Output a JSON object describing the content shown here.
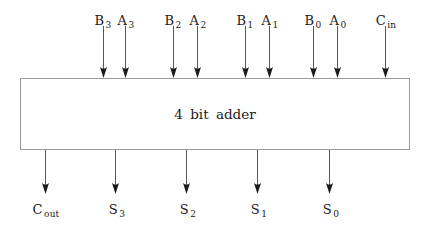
{
  "diagram": {
    "title": "4 bit adder",
    "block_label": "4  bit  adder",
    "type": "block-diagram",
    "background_color": "#ffffff",
    "line_color": "#58585a",
    "box_border_color": "#9a9a9c",
    "text_color": "#1a1a1a",
    "box": {
      "x": 20,
      "y": 78,
      "width": 390,
      "height": 72
    },
    "inputs": [
      {
        "name": "B3",
        "base": "B",
        "sub": "3",
        "x": 103,
        "label_x": 103,
        "label_y": 14,
        "line_top": 26,
        "line_bottom": 78
      },
      {
        "name": "A3",
        "base": "A",
        "sub": "3",
        "x": 125,
        "label_x": 126,
        "label_y": 14,
        "line_top": 26,
        "line_bottom": 78
      },
      {
        "name": "B2",
        "base": "B",
        "sub": "2",
        "x": 173,
        "label_x": 173,
        "label_y": 14,
        "line_top": 26,
        "line_bottom": 78
      },
      {
        "name": "A2",
        "base": "A",
        "sub": "2",
        "x": 197,
        "label_x": 198,
        "label_y": 14,
        "line_top": 26,
        "line_bottom": 78
      },
      {
        "name": "B1",
        "base": "B",
        "sub": "1",
        "x": 245,
        "label_x": 245,
        "label_y": 14,
        "line_top": 26,
        "line_bottom": 78
      },
      {
        "name": "A1",
        "base": "A",
        "sub": "1",
        "x": 269,
        "label_x": 270,
        "label_y": 14,
        "line_top": 26,
        "line_bottom": 78
      },
      {
        "name": "B0",
        "base": "B",
        "sub": "0",
        "x": 313,
        "label_x": 313,
        "label_y": 14,
        "line_top": 26,
        "line_bottom": 78
      },
      {
        "name": "A0",
        "base": "A",
        "sub": "0",
        "x": 337,
        "label_x": 338,
        "label_y": 14,
        "line_top": 26,
        "line_bottom": 78
      },
      {
        "name": "Cin",
        "base": "C",
        "sub": "in",
        "x": 385,
        "label_x": 386,
        "label_y": 14,
        "line_top": 26,
        "line_bottom": 78
      }
    ],
    "outputs": [
      {
        "name": "Cout",
        "base": "C",
        "sub": "out",
        "x": 45,
        "label_x": 46,
        "label_y": 203,
        "line_top": 150,
        "line_bottom": 194
      },
      {
        "name": "S3",
        "base": "S",
        "sub": "3",
        "x": 115,
        "label_x": 117,
        "label_y": 203,
        "line_top": 150,
        "line_bottom": 194
      },
      {
        "name": "S2",
        "base": "S",
        "sub": "2",
        "x": 186,
        "label_x": 188,
        "label_y": 203,
        "line_top": 150,
        "line_bottom": 194
      },
      {
        "name": "S1",
        "base": "S",
        "sub": "1",
        "x": 257,
        "label_x": 259,
        "label_y": 203,
        "line_top": 150,
        "line_bottom": 194
      },
      {
        "name": "S0",
        "base": "S",
        "sub": "0",
        "x": 329,
        "label_x": 331,
        "label_y": 203,
        "line_top": 150,
        "line_bottom": 194
      }
    ]
  }
}
